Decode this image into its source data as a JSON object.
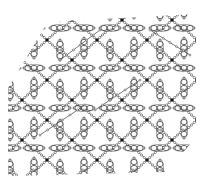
{
  "figure": {
    "title": "",
    "width": 206,
    "height": 181,
    "colors": {
      "bond": "#555555",
      "atom_fill": "#ffffff",
      "metal": "#111111",
      "ring": "#444444",
      "background": "#ffffff"
    },
    "outline_polygon": [
      [
        48,
        22
      ],
      [
        196,
        14
      ],
      [
        196,
        138
      ],
      [
        165,
        172
      ],
      [
        8,
        176
      ],
      [
        8,
        88
      ]
    ],
    "lattice": {
      "origin": [
        22,
        20
      ],
      "a": [
        50,
        0
      ],
      "b": [
        0,
        40
      ],
      "cols": 5,
      "rows": 5
    },
    "metal_centers_offset": [
      [
        0,
        0
      ],
      [
        25,
        20
      ]
    ],
    "ring_molecules": [
      {
        "dx": 12,
        "dy": 8,
        "orient": "h"
      },
      {
        "dx": 38,
        "dy": 8,
        "orient": "h"
      },
      {
        "dx": 12,
        "dy": 28,
        "orient": "v"
      },
      {
        "dx": 38,
        "dy": 30,
        "orient": "v"
      }
    ],
    "diagonal_links": [
      [
        [
          60,
          60
        ],
        [
          100,
          30
        ]
      ],
      [
        [
          40,
          135
        ],
        [
          85,
          105
        ]
      ],
      [
        [
          95,
          110
        ],
        [
          140,
          80
        ]
      ],
      [
        [
          150,
          30
        ],
        [
          190,
          55
        ]
      ]
    ]
  }
}
